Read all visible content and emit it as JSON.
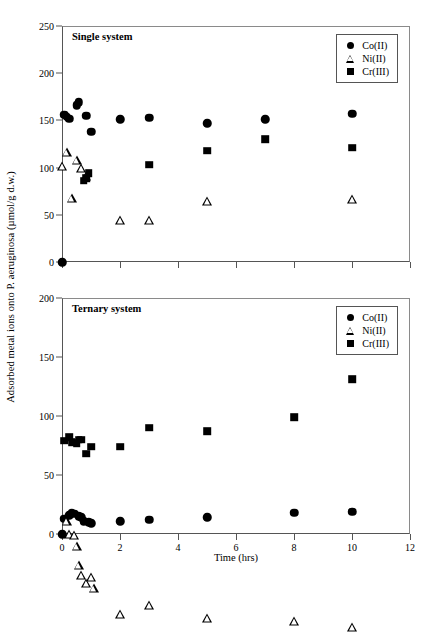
{
  "figure": {
    "ylabel": "Adsorbed metal ions onto P. aeruginosa (µmol/g d.w.)",
    "xlabel": "Time (hrs)"
  },
  "chart_data": [
    {
      "type": "scatter",
      "title": "Single system",
      "xlabel": "Time (hrs)",
      "ylabel": "Adsorbed metal ions onto P. aeruginosa (µmol/g d.w.)",
      "xlim": [
        0,
        12
      ],
      "ylim": [
        0,
        250
      ],
      "xticks": [
        0,
        2,
        4,
        6,
        8,
        10,
        12
      ],
      "yticks": [
        0,
        50,
        100,
        150,
        200,
        250
      ],
      "grid": false,
      "legend_position": "top-right",
      "series": [
        {
          "name": "Co(II)",
          "marker": "filled-circle",
          "color": "#000000",
          "points": [
            [
              0.0,
              0
            ],
            [
              0.08,
              156
            ],
            [
              0.17,
              154
            ],
            [
              0.25,
              152
            ],
            [
              0.5,
              166
            ],
            [
              0.58,
              169
            ],
            [
              0.83,
              155
            ],
            [
              1.0,
              138
            ],
            [
              2.0,
              151
            ],
            [
              3.0,
              153
            ],
            [
              5.0,
              147
            ],
            [
              7.0,
              151
            ],
            [
              10.0,
              157
            ]
          ]
        },
        {
          "name": "Ni(II)",
          "marker": "open-triangle",
          "color": "#000000",
          "points": [
            [
              0.0,
              102
            ],
            [
              0.17,
              126
            ],
            [
              0.5,
              127
            ],
            [
              0.67,
              128
            ],
            [
              0.83,
              129
            ],
            [
              0.33,
              115
            ],
            [
              2.0,
              102
            ],
            [
              3.0,
              111
            ],
            [
              5.0,
              141
            ],
            [
              10.0,
              153
            ]
          ]
        },
        {
          "name": "Cr(III)",
          "marker": "filled-square",
          "color": "#000000",
          "points": [
            [
              0.75,
              86
            ],
            [
              0.83,
              89
            ],
            [
              0.92,
              94
            ],
            [
              3.0,
              103
            ],
            [
              5.0,
              118
            ],
            [
              7.0,
              130
            ],
            [
              10.0,
              121
            ]
          ]
        }
      ]
    },
    {
      "type": "scatter",
      "title": "Ternary system",
      "xlabel": "Time (hrs)",
      "ylabel": "Adsorbed metal ions onto P. aeruginosa (µmol/g d.w.)",
      "xlim": [
        0,
        12
      ],
      "ylim": [
        0,
        200
      ],
      "xticks": [
        0,
        2,
        4,
        6,
        8,
        10,
        12
      ],
      "yticks": [
        0,
        50,
        100,
        150,
        200
      ],
      "grid": false,
      "legend_position": "top-right",
      "series": [
        {
          "name": "Co(II)",
          "marker": "filled-circle",
          "color": "#000000",
          "points": [
            [
              0.0,
              0
            ],
            [
              0.08,
              13
            ],
            [
              0.25,
              16
            ],
            [
              0.33,
              18
            ],
            [
              0.42,
              17
            ],
            [
              0.58,
              15
            ],
            [
              0.67,
              14
            ],
            [
              0.75,
              11
            ],
            [
              0.92,
              10
            ],
            [
              1.0,
              9
            ],
            [
              2.0,
              11
            ],
            [
              3.0,
              12
            ],
            [
              5.0,
              14
            ],
            [
              8.0,
              18
            ],
            [
              10.0,
              19
            ]
          ]
        },
        {
          "name": "Ni(II)",
          "marker": "open-triangle",
          "color": "#000000",
          "points": [
            [
              0.17,
              11
            ],
            [
              0.25,
              8
            ],
            [
              0.42,
              14
            ],
            [
              0.5,
              13
            ],
            [
              0.58,
              4
            ],
            [
              0.67,
              3
            ],
            [
              0.83,
              4
            ],
            [
              1.0,
              17
            ],
            [
              1.1,
              15
            ],
            [
              2.0,
              1
            ],
            [
              3.0,
              16
            ],
            [
              5.0,
              13
            ],
            [
              8.0,
              18
            ],
            [
              10.0,
              20
            ]
          ]
        },
        {
          "name": "Cr(III)",
          "marker": "filled-square",
          "color": "#000000",
          "points": [
            [
              0.08,
              79
            ],
            [
              0.25,
              82
            ],
            [
              0.33,
              78
            ],
            [
              0.5,
              77
            ],
            [
              0.58,
              80
            ],
            [
              0.67,
              80
            ],
            [
              0.83,
              68
            ],
            [
              1.0,
              74
            ],
            [
              2.0,
              74
            ],
            [
              3.0,
              90
            ],
            [
              5.0,
              87
            ],
            [
              8.0,
              99
            ],
            [
              10.0,
              131
            ]
          ]
        }
      ]
    }
  ]
}
